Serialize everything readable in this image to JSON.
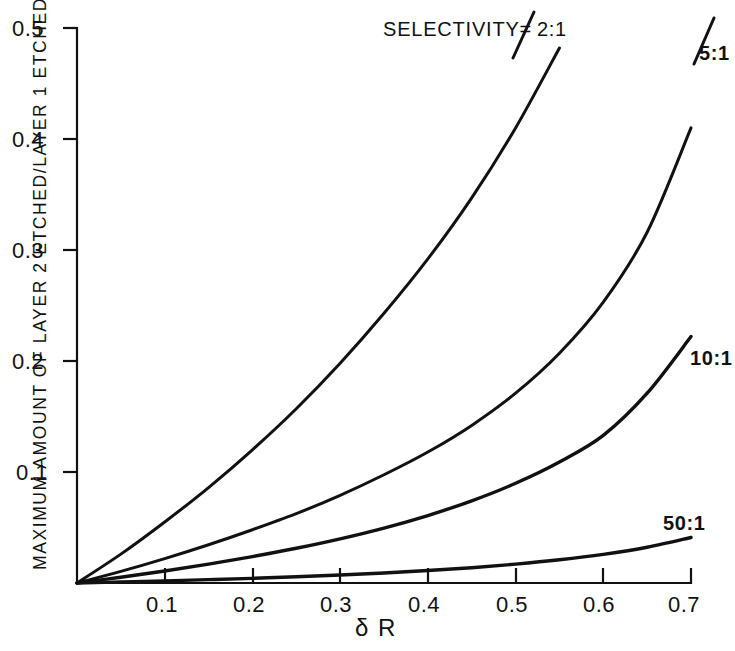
{
  "figure": {
    "background": "#ffffff",
    "ink": "#111111"
  },
  "chart_data": {
    "type": "line",
    "title": "",
    "xlabel": "δ R",
    "ylabel": "MAXIMUM AMOUNT OF LAYER 2 ETCHED/LAYER 1 ETCHED",
    "annotation": "SELECTIVITY=",
    "xlim": [
      0.0,
      0.7
    ],
    "ylim": [
      0.0,
      0.5
    ],
    "xticks": [
      0.1,
      0.2,
      0.3,
      0.4,
      0.5,
      0.6,
      0.7
    ],
    "xtick_labels": [
      "0.1",
      "0.2",
      "0.3",
      "0.4",
      "0.5",
      "0.6",
      "0.7"
    ],
    "yticks": [
      0.1,
      0.2,
      0.3,
      0.4,
      0.5
    ],
    "ytick_labels": [
      "0.1",
      "0.2",
      "0.3",
      "0.4",
      "0.5"
    ],
    "grid": false,
    "legend": "inline-curve-labels",
    "x": [
      0.0,
      0.05,
      0.1,
      0.15,
      0.2,
      0.25,
      0.3,
      0.35,
      0.4,
      0.45,
      0.5,
      0.55,
      0.6,
      0.65,
      0.7
    ],
    "series": [
      {
        "name": "2:1",
        "label": "2:1",
        "values": [
          0.0,
          0.026,
          0.055,
          0.086,
          0.12,
          0.157,
          0.198,
          0.243,
          0.292,
          0.347,
          0.41,
          0.482,
          null,
          null,
          null
        ],
        "label_x": 0.74,
        "exit_x": 0.512
      },
      {
        "name": "5:1",
        "label": "5:1",
        "values": [
          0.0,
          0.0105,
          0.022,
          0.0345,
          0.048,
          0.0625,
          0.079,
          0.0975,
          0.118,
          0.142,
          0.171,
          0.207,
          0.253,
          0.316,
          0.41
        ],
        "label_x": 0.96,
        "exit_x": 0.645
      },
      {
        "name": "10:1",
        "label": "10:1",
        "values": [
          0.0,
          0.0052,
          0.0108,
          0.017,
          0.0238,
          0.0313,
          0.0398,
          0.0495,
          0.0608,
          0.074,
          0.0898,
          0.109,
          0.133,
          0.171,
          0.222
        ],
        "label_x": 0.72,
        "exit_x": null
      },
      {
        "name": "50:1",
        "label": "50:1",
        "values": [
          0.0,
          0.0009,
          0.0019,
          0.003,
          0.0042,
          0.0056,
          0.0072,
          0.009,
          0.0112,
          0.0138,
          0.017,
          0.0209,
          0.0258,
          0.0322,
          0.041
        ],
        "label_x": 0.64,
        "exit_x": null
      }
    ]
  },
  "labels": {
    "selectivity": "SELECTIVITY=",
    "s2": "2:1",
    "s5": "5:1",
    "s10": "10:1",
    "s50": "50:1",
    "xaxis": "δ R",
    "yaxis": "MAXIMUM AMOUNT OF LAYER 2 ETCHED/LAYER 1 ETCHED",
    "xt1": "0.1",
    "xt2": "0.2",
    "xt3": "0.3",
    "xt4": "0.4",
    "xt5": "0.5",
    "xt6": "0.6",
    "xt7": "0.7",
    "yt1": "0.1",
    "yt2": "0.2",
    "yt3": "0.3",
    "yt4": "0.4",
    "yt5": "0.5"
  }
}
